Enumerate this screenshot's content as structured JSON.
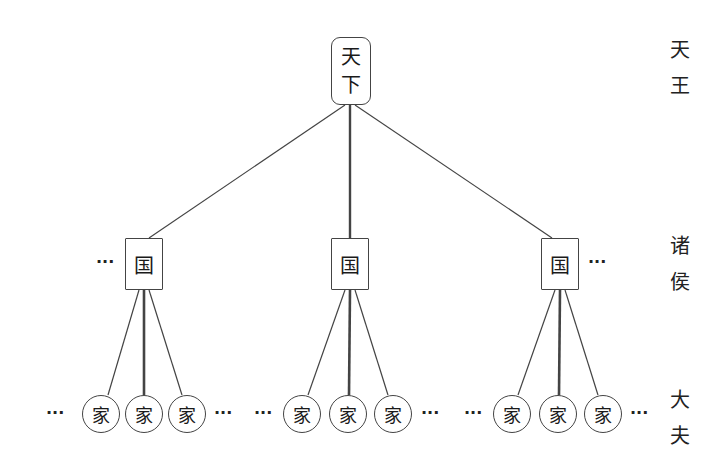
{
  "diagram": {
    "type": "hierarchy-tree",
    "levels": [
      {
        "name": "tianxia",
        "label_lines": [
          "天",
          "王"
        ]
      },
      {
        "name": "guo",
        "label_lines": [
          "诸",
          "侯"
        ]
      },
      {
        "name": "jia",
        "label_lines": [
          "大",
          "夫"
        ]
      }
    ],
    "root": {
      "lines": [
        "天",
        "下"
      ]
    },
    "states": [
      {
        "label": "国",
        "left_ellipsis": "···",
        "right_ellipsis": "",
        "families": [
          "家",
          "家",
          "家"
        ],
        "families_left_ellipsis": "···",
        "families_right_ellipsis": "···"
      },
      {
        "label": "国",
        "left_ellipsis": "",
        "right_ellipsis": "",
        "families": [
          "家",
          "家",
          "家"
        ],
        "families_left_ellipsis": "···",
        "families_right_ellipsis": "···"
      },
      {
        "label": "国",
        "left_ellipsis": "",
        "right_ellipsis": "···",
        "families": [
          "家",
          "家",
          "家"
        ],
        "families_left_ellipsis": "···",
        "families_right_ellipsis": "···"
      }
    ],
    "colors": {
      "line": "#444444",
      "text": "#1a1a1a",
      "background": "#ffffff"
    }
  }
}
